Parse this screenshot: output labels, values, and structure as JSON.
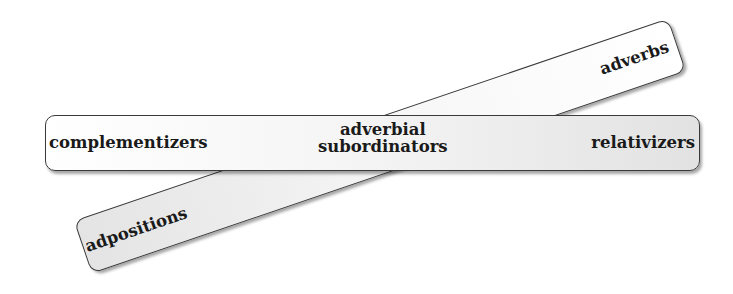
{
  "diagram": {
    "tilted_bar": {
      "labels": {
        "top_right": "adverbs",
        "bottom_left": "adpositions"
      }
    },
    "horizontal_bar": {
      "labels": {
        "left": "complementizers",
        "center_line1": "adverbial",
        "center_line2": "subordinators",
        "right": "relativizers"
      }
    },
    "colors": {
      "border": "#3a3a3a",
      "fill_light": "#ffffff",
      "fill_dark": "#e2e2e2",
      "text": "#1a1a1a"
    }
  }
}
